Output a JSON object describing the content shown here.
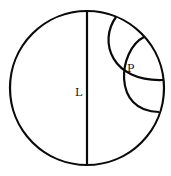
{
  "colors": {
    "stroke": "#0a0a0a",
    "background": "#ffffff"
  },
  "labels": {
    "line": "L",
    "point": "P"
  },
  "elements": {
    "disk": {
      "cx": 87,
      "cy": 88,
      "r": 77
    },
    "line_L": {
      "x": 87,
      "y1": 11,
      "y2": 165
    },
    "arc_1": {
      "from": [
        116,
        17
      ],
      "to": [
        163,
        80
      ]
    },
    "arc_2": {
      "from": [
        144,
        37
      ],
      "to": [
        159,
        112
      ]
    },
    "point_P": [
      123,
      73
    ]
  }
}
